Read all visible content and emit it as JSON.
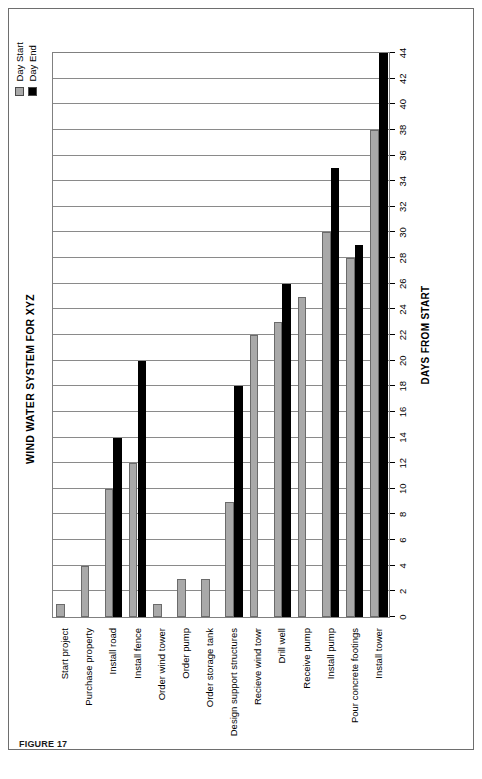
{
  "figure": {
    "caption": "FIGURE 17"
  },
  "legend": {
    "position": "top-right",
    "items": [
      {
        "label": "Day Start",
        "color": "#a9a9a9"
      },
      {
        "label": "Day End",
        "color": "#000000"
      }
    ]
  },
  "chart_data": {
    "type": "bar",
    "orientation": "horizontal",
    "title": "WIND WATER SYSTEM FOR XYZ",
    "xlabel": "DAYS FROM START",
    "ylabel": "",
    "xlim": [
      0,
      44
    ],
    "xtick_step": 2,
    "grid": true,
    "categories": [
      "Start project",
      "Purchase property",
      "Install road",
      "Install fence",
      "Order wind tower",
      "Order pump",
      "Order storage tank",
      "Design support structures",
      "Recieve wind towr",
      "Drill well",
      "Receive pump",
      "Install pump",
      "Pour concrete footings",
      "Install tower"
    ],
    "xticks": [
      0,
      2,
      4,
      6,
      8,
      10,
      12,
      14,
      16,
      18,
      20,
      22,
      24,
      26,
      28,
      30,
      32,
      34,
      36,
      38,
      40,
      42,
      44
    ],
    "series": [
      {
        "name": "Day Start",
        "color": "#a9a9a9",
        "values": [
          1,
          4,
          10,
          12,
          1,
          3,
          3,
          9,
          22,
          23,
          25,
          30,
          28,
          38
        ]
      },
      {
        "name": "Day End",
        "color": "#000000",
        "values": [
          0,
          0,
          14,
          20,
          0,
          0,
          0,
          18,
          0,
          26,
          0,
          35,
          29,
          44
        ]
      }
    ]
  }
}
